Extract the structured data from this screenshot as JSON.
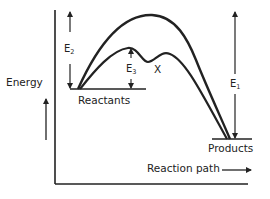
{
  "diagram": {
    "type": "energy-profile",
    "axes": {
      "y_label": "Energy",
      "x_label": "Reaction path"
    },
    "levels": {
      "reactants": "Reactants",
      "products": "Products"
    },
    "energies": {
      "e2": {
        "symbol": "E",
        "subscript": "2"
      },
      "e3": {
        "symbol": "E",
        "subscript": "3"
      },
      "e1": {
        "symbol": "E",
        "subscript": "1"
      }
    },
    "intermediate_label": "X",
    "colors": {
      "line": "#222222",
      "background": "#ffffff"
    }
  }
}
